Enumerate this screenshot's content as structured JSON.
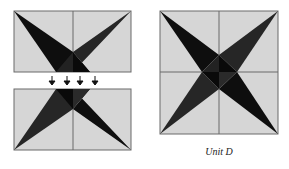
{
  "diagram": {
    "caption": "Unit D",
    "colors": {
      "background": "#d6d6d6",
      "dark": "#0e0e0e",
      "medium": "#2a2a2a",
      "line": "#6a6a6a",
      "arrow": "#111111"
    },
    "parts": [
      {
        "name": "top-half-block",
        "description": "Rectangle with two dark triangles forming a V"
      },
      {
        "name": "arrows",
        "count": 4,
        "direction": "down"
      },
      {
        "name": "bottom-half-block",
        "description": "Rectangle with two dark triangles forming an inverted V"
      },
      {
        "name": "assembled-unit",
        "description": "Square with four-pointed star"
      }
    ]
  }
}
